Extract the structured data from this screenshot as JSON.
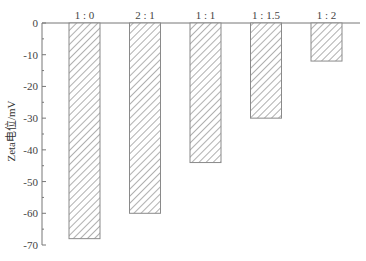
{
  "chart_data": {
    "type": "bar",
    "title": "",
    "xlabel": "",
    "ylabel": "Zeta电位/mV",
    "categories": [
      "1:0",
      "2:1",
      "1:1",
      "1:1.5",
      "1:2"
    ],
    "values": [
      -68,
      -60,
      -44,
      -30,
      -12
    ],
    "ylim": [
      -70,
      0
    ],
    "yticks": [
      0,
      -10,
      -20,
      -30,
      -40,
      -50,
      -60,
      -70
    ],
    "ytick_labels": [
      "0",
      "-10",
      "-20",
      "-30",
      "-40",
      "-50",
      "-60",
      "-70"
    ],
    "grid": false,
    "legend": null,
    "category_labels_position": "top (along zero line)",
    "bar_fill": "diagonal hatch",
    "colors": {
      "hatch": "#7a7a7a",
      "bar_border": "#8a8a8a",
      "axis": "#777777"
    }
  }
}
